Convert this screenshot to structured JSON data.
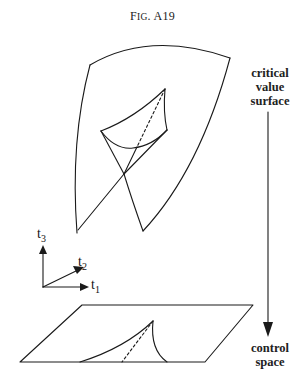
{
  "figure": {
    "title_prefix": "F",
    "title_smallcaps": "IG",
    "title_suffix": ". A19"
  },
  "labels": {
    "critical_surface": [
      "critical",
      "value",
      "surface"
    ],
    "control_space": [
      "control",
      "space"
    ]
  },
  "axes": {
    "t1": {
      "base": "t",
      "sub": "1"
    },
    "t2": {
      "base": "t",
      "sub": "2"
    },
    "t3": {
      "base": "t",
      "sub": "3"
    }
  },
  "colors": {
    "stroke": "#1a1a1a",
    "background": "#ffffff"
  }
}
